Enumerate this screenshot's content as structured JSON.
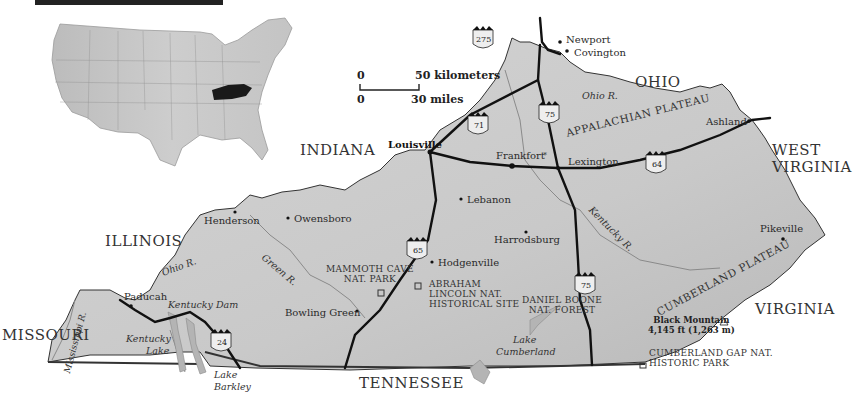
{
  "map": {
    "title_bar_fragment": "",
    "inset": {
      "highlighted_state": "Kentucky",
      "description": "Contiguous United States locator map"
    },
    "scale": {
      "km_zero": "0",
      "km_label": "50 kilometers",
      "mi_zero": "0",
      "mi_label": "30 miles"
    },
    "neighboring_states": {
      "ohio": "OHIO",
      "indiana": "INDIANA",
      "illinois": "ILLINOIS",
      "missouri": "MISSOURI",
      "west_virginia_1": "WEST",
      "west_virginia_2": "VIRGINIA",
      "virginia": "VIRGINIA",
      "tennessee": "TENNESSEE"
    },
    "cities": {
      "newport": "Newport",
      "covington": "Covington",
      "louisville": "Louisville",
      "frankfort": "Frankfort",
      "lexington": "Lexington",
      "ashland": "Ashland",
      "lebanon": "Lebanon",
      "harrodsburg": "Harrodsburg",
      "hodgenville": "Hodgenville",
      "owensboro": "Owensboro",
      "henderson": "Henderson",
      "paducah": "Paducah",
      "bowling_green": "Bowling Green",
      "pikeville": "Pikeville",
      "capital_marker": "*"
    },
    "rivers": {
      "ohio_east": "Ohio R.",
      "ohio_west": "Ohio R.",
      "green": "Green R.",
      "kentucky": "Kentucky R.",
      "mississippi": "Mississippi R."
    },
    "water": {
      "kentucky_dam": "Kentucky Dam",
      "kentucky_lake_1": "Kentucky",
      "kentucky_lake_2": "Lake",
      "lake_barkley_1": "Lake",
      "lake_barkley_2": "Barkley",
      "lake_cumberland_1": "Lake",
      "lake_cumberland_2": "Cumberland"
    },
    "regions": {
      "appalachian": "APPALACHIAN PLATEAU",
      "cumberland": "CUMBERLAND PLATEAU"
    },
    "parks": {
      "mammoth_1": "MAMMOTH CAVE",
      "mammoth_2": "NAT. PARK",
      "lincoln_1": "ABRAHAM",
      "lincoln_2": "LINCOLN NAT.",
      "lincoln_3": "HISTORICAL SITE",
      "boone_1": "DANIEL BOONE",
      "boone_2": "NAT. FOREST",
      "cumberland_gap_1": "CUMBERLAND GAP NAT.",
      "cumberland_gap_2": "HISTORIC PARK"
    },
    "peak": {
      "name": "Black Mountain",
      "elevation": "4,145 ft (1,263 m)"
    },
    "interstates": {
      "i275": "275",
      "i71": "71",
      "i75_north": "75",
      "i64": "64",
      "i65": "65",
      "i75_south": "75",
      "i24": "24"
    },
    "colors": {
      "land": "#cfcfcf",
      "land_dark": "#bdbdbd",
      "border": "#2a2a2a",
      "road": "#111111",
      "river": "#8a8a8a",
      "lake": "#b8b8b8",
      "inset_highlight": "#1a1a1a"
    }
  }
}
